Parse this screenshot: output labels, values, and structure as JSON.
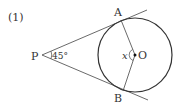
{
  "problem": {
    "number_label": "(1)"
  },
  "diagram": {
    "points": {
      "P": {
        "label": "P",
        "x": 42,
        "y": 55
      },
      "A": {
        "label": "A",
        "x": 121,
        "y": 23
      },
      "B": {
        "label": "B",
        "x": 124,
        "y": 89
      },
      "O": {
        "label": "O",
        "x": 135,
        "y": 55
      }
    },
    "circle": {
      "cx": 135,
      "cy": 55,
      "r": 37
    },
    "angle_P_label": "45°",
    "angle_O_label": "x",
    "colors": {
      "stroke": "#333333",
      "text": "#333333"
    }
  }
}
